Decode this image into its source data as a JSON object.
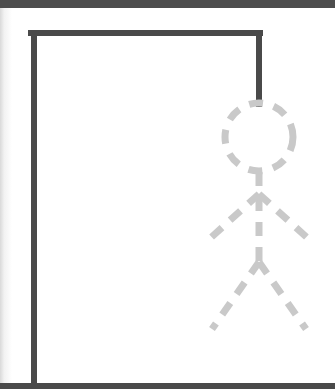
{
  "app": {
    "title": "Hangman",
    "screen_width": 335,
    "screen_height": 389
  },
  "chrome": {
    "top_bar_label": "top-bar",
    "bottom_bar_label": "bottom-bar",
    "left_edge_label": "page-edge-shadow"
  },
  "colors": {
    "background": "#ffffff",
    "gallows": "#4a4a4a",
    "figure": "#c9c9c9",
    "bar": "#4d4d4d",
    "edge_shadow": "#d9d9d9"
  },
  "gallows": {
    "name": "gallows",
    "stroke": "#4a4a4a",
    "stroke_width": 6,
    "post": {
      "x1": 34,
      "y1": 33,
      "x2": 34,
      "y2": 386
    },
    "beam": {
      "x1": 31,
      "y1": 33,
      "x2": 260,
      "y2": 33
    },
    "rope": {
      "x1": 259,
      "y1": 33,
      "x2": 259,
      "y2": 104
    }
  },
  "figure": {
    "name": "hangman-stick-figure",
    "stroke": "#c9c9c9",
    "stroke_width": 7,
    "dash": "14 11",
    "parts_drawn": 6,
    "parts_total": 6,
    "head": {
      "cx": 259,
      "cy": 137,
      "r": 34
    },
    "body": {
      "x1": 259,
      "y1": 172,
      "x2": 259,
      "y2": 268
    },
    "arm_left": {
      "x1": 259,
      "y1": 194,
      "x2": 205,
      "y2": 243
    },
    "arm_right": {
      "x1": 259,
      "y1": 194,
      "x2": 313,
      "y2": 243
    },
    "leg_left": {
      "x1": 259,
      "y1": 262,
      "x2": 212,
      "y2": 329
    },
    "leg_right": {
      "x1": 259,
      "y1": 262,
      "x2": 306,
      "y2": 329
    }
  }
}
